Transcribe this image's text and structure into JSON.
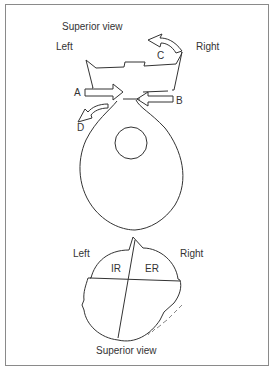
{
  "top_figure": {
    "title": "Superior view",
    "left_label": "Left",
    "right_label": "Right",
    "arrow_labels": {
      "a": "A",
      "b": "B",
      "c": "C",
      "d": "D"
    }
  },
  "bottom_figure": {
    "title": "Superior view",
    "left_label": "Left",
    "right_label": "Right",
    "quadrant_labels": {
      "ir": "IR",
      "er": "ER"
    },
    "signature": "artist-signature"
  },
  "colors": {
    "line": "#333333",
    "frame": "#8a8a8a",
    "background": "#ffffff"
  }
}
